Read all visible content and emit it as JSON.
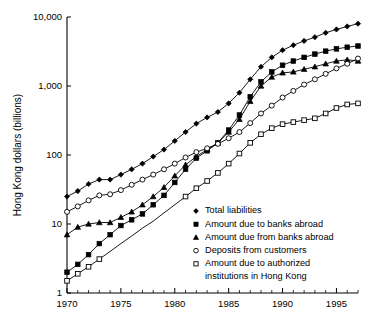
{
  "chart_data": {
    "type": "line",
    "title": "",
    "xlabel": "",
    "ylabel": "Hong Kong dollars (billions)",
    "yscale": "log",
    "ylim": [
      1,
      10000
    ],
    "xlim": [
      1970,
      1997
    ],
    "ytick_labels": [
      "10,000",
      "1,000",
      "100",
      "10",
      "1"
    ],
    "ytick_values": [
      10000,
      1000,
      100,
      10,
      1
    ],
    "xtick_labels": [
      "1970",
      "1975",
      "1980",
      "1985",
      "1990",
      "1995"
    ],
    "xtick_values": [
      1970,
      1975,
      1980,
      1985,
      1990,
      1995
    ],
    "grid": false,
    "legend_position": "lower-right",
    "x": [
      1970,
      1971,
      1972,
      1973,
      1974,
      1975,
      1976,
      1977,
      1978,
      1979,
      1980,
      1981,
      1982,
      1983,
      1984,
      1985,
      1986,
      1987,
      1988,
      1989,
      1990,
      1991,
      1992,
      1993,
      1994,
      1995,
      1996,
      1997
    ],
    "series": [
      {
        "name": "Total liabilities",
        "marker": "filled-diamond",
        "values": [
          25,
          30,
          38,
          44,
          44,
          52,
          62,
          75,
          95,
          120,
          160,
          215,
          285,
          350,
          420,
          560,
          800,
          1250,
          1900,
          2600,
          3300,
          3900,
          4500,
          5100,
          5900,
          6600,
          7300,
          8000
        ]
      },
      {
        "name": "Amount due to banks abroad",
        "marker": "filled-square",
        "values": [
          2.0,
          2.6,
          3.6,
          5.2,
          7.0,
          9.5,
          11.5,
          14,
          19,
          26,
          40,
          62,
          90,
          115,
          150,
          230,
          380,
          700,
          1150,
          1600,
          2000,
          2300,
          2600,
          2900,
          3200,
          3450,
          3650,
          3800
        ]
      },
      {
        "name": "Amount due from banks abroad",
        "marker": "filled-triangle",
        "values": [
          7.0,
          9.0,
          10.0,
          10.5,
          10.5,
          12.5,
          15,
          19,
          25,
          34,
          50,
          72,
          95,
          120,
          150,
          215,
          330,
          600,
          1000,
          1350,
          1550,
          1600,
          1750,
          1900,
          2100,
          2300,
          2400,
          2300
        ]
      },
      {
        "name": "Deposits from customers",
        "marker": "open-circle",
        "values": [
          15,
          18,
          22,
          26,
          27,
          31,
          37,
          44,
          52,
          62,
          75,
          92,
          110,
          125,
          145,
          175,
          215,
          290,
          400,
          520,
          680,
          850,
          1050,
          1250,
          1500,
          1800,
          2100,
          2500
        ]
      },
      {
        "name": "Amount due to authorized institutions in Hong Kong",
        "marker": "open-square",
        "values": [
          1.5,
          1.9,
          2.4,
          3.1,
          4.0,
          5.2,
          6.7,
          8.7,
          11,
          14.5,
          19,
          25,
          33,
          42,
          55,
          75,
          105,
          150,
          200,
          245,
          280,
          300,
          320,
          340,
          400,
          480,
          540,
          560
        ]
      }
    ]
  },
  "legend": {
    "items": [
      {
        "label": "Total liabilities",
        "marker": "filled-diamond"
      },
      {
        "label": "Amount due to banks abroad",
        "marker": "filled-square"
      },
      {
        "label": "Amount due from banks abroad",
        "marker": "filled-triangle"
      },
      {
        "label": "Deposits from customers",
        "marker": "open-circle"
      },
      {
        "label": "Amount due to authorized",
        "marker": "open-square"
      },
      {
        "label": "institutions in Hong Kong",
        "marker": "none"
      }
    ]
  }
}
